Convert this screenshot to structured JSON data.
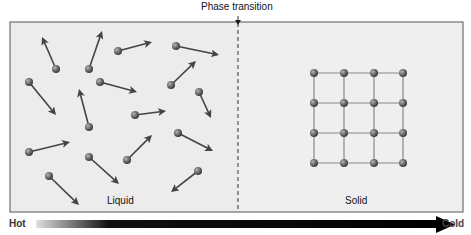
{
  "title": "Phase transition",
  "regions": {
    "liquid": {
      "label": "Liquid"
    },
    "solid": {
      "label": "Solid"
    }
  },
  "temperature_axis": {
    "start_label": "Hot",
    "end_label": "Cold"
  },
  "colors": {
    "panel_fill": "#ececec",
    "panel_border": "#555555",
    "molecule": "#6b6b6b",
    "arrow": "#444444",
    "lattice_bond": "#888888",
    "gradient_start": "#d8d8d8",
    "gradient_end": "#000000"
  },
  "liquid_molecules": [
    {
      "x": 56,
      "y": 69,
      "tx": 42,
      "ty": 37
    },
    {
      "x": 89,
      "y": 69,
      "tx": 102,
      "ty": 31
    },
    {
      "x": 118,
      "y": 51,
      "tx": 152,
      "ty": 42
    },
    {
      "x": 176,
      "y": 46,
      "tx": 219,
      "ty": 55
    },
    {
      "x": 29,
      "y": 82,
      "tx": 56,
      "ty": 115
    },
    {
      "x": 100,
      "y": 82,
      "tx": 137,
      "ty": 92
    },
    {
      "x": 171,
      "y": 85,
      "tx": 196,
      "ty": 61
    },
    {
      "x": 89,
      "y": 127,
      "tx": 79,
      "ty": 89
    },
    {
      "x": 135,
      "y": 115,
      "tx": 166,
      "ty": 111
    },
    {
      "x": 199,
      "y": 92,
      "tx": 211,
      "ty": 118
    },
    {
      "x": 29,
      "y": 152,
      "tx": 70,
      "ty": 142
    },
    {
      "x": 89,
      "y": 157,
      "tx": 119,
      "ty": 184
    },
    {
      "x": 127,
      "y": 160,
      "tx": 152,
      "ty": 135
    },
    {
      "x": 178,
      "y": 133,
      "tx": 213,
      "ty": 151
    },
    {
      "x": 49,
      "y": 176,
      "tx": 79,
      "ty": 205
    },
    {
      "x": 198,
      "y": 171,
      "tx": 171,
      "ty": 192
    }
  ],
  "solid_lattice": {
    "columns": [
      314,
      344,
      374,
      403
    ],
    "rows": [
      73,
      103,
      133,
      163
    ]
  }
}
